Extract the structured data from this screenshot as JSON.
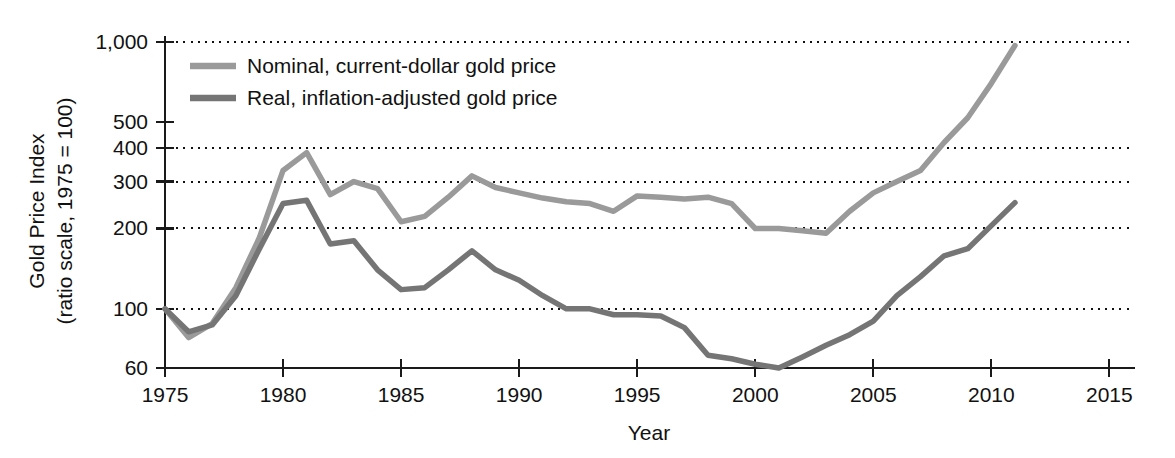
{
  "chart_data": {
    "type": "line",
    "title": "",
    "xlabel": "Year",
    "ylabel": "Gold Price Index",
    "ylabel_line2": "(ratio scale, 1975 = 100)",
    "scale": "log",
    "grid": true,
    "legend_position": "top-left-inside",
    "xlim": [
      1975,
      2016
    ],
    "ylim": [
      60,
      1000
    ],
    "xticks": [
      1975,
      1980,
      1985,
      1990,
      1995,
      2000,
      2005,
      2010,
      2015
    ],
    "xtick_labels": [
      "1975",
      "1980",
      "1985",
      "1990",
      "1995",
      "2000",
      "2005",
      "2010",
      "2015"
    ],
    "yticks": [
      60,
      100,
      200,
      300,
      400,
      500,
      1000
    ],
    "ytick_labels": [
      "60",
      "100",
      "200",
      "300",
      "400",
      "500",
      "1,000"
    ],
    "gridline_values": [
      100,
      200,
      300,
      400,
      1000
    ],
    "colors": {
      "nominal": "#9a9a9a",
      "real": "#757575",
      "axis": "#1a1a1a",
      "grid": "#111111",
      "background": "#ffffff"
    },
    "x": [
      1975,
      1976,
      1977,
      1978,
      1979,
      1980,
      1981,
      1982,
      1983,
      1984,
      1985,
      1986,
      1987,
      1988,
      1989,
      1990,
      1991,
      1992,
      1993,
      1994,
      1995,
      1996,
      1997,
      1998,
      1999,
      2000,
      2001,
      2002,
      2003,
      2004,
      2005,
      2006,
      2007,
      2008,
      2009,
      2010,
      2011
    ],
    "series": [
      {
        "name": "Nominal, current-dollar gold price",
        "key": "nominal",
        "color": "#9a9a9a",
        "values": [
          100,
          78,
          88,
          120,
          185,
          330,
          385,
          268,
          300,
          282,
          212,
          222,
          262,
          315,
          285,
          272,
          260,
          252,
          248,
          232,
          265,
          262,
          258,
          262,
          248,
          200,
          200,
          196,
          192,
          232,
          272,
          300,
          330,
          420,
          520,
          700,
          970
        ]
      },
      {
        "name": "Real, inflation-adjusted gold price",
        "key": "real",
        "color": "#757575",
        "values": [
          100,
          82,
          87,
          112,
          168,
          248,
          255,
          175,
          180,
          140,
          118,
          120,
          140,
          165,
          140,
          128,
          112,
          100,
          100,
          95,
          95,
          94,
          85,
          67,
          65,
          62,
          60,
          66,
          73,
          80,
          90,
          112,
          132,
          158,
          168,
          205,
          250
        ]
      }
    ],
    "legend": [
      {
        "label": "Nominal, current-dollar gold price",
        "color": "#9a9a9a"
      },
      {
        "label": "Real, inflation-adjusted gold price",
        "color": "#757575"
      }
    ]
  }
}
